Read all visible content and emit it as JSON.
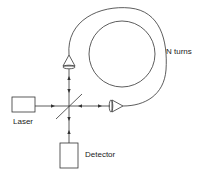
{
  "diagram": {
    "type": "fiber optic gyroscope (Sagnac interferometer) schematic",
    "labels": {
      "laser": "Laser",
      "detector": "Detector",
      "coil": "N turns"
    },
    "components": [
      {
        "name": "laser",
        "shape": "rectangle"
      },
      {
        "name": "beam-splitter",
        "shape": "diagonal line"
      },
      {
        "name": "top-coupling-lens",
        "shape": "triangle-up"
      },
      {
        "name": "right-coupling-lens",
        "shape": "triangle-right"
      },
      {
        "name": "fiber-coil",
        "shape": "loop with N turns"
      },
      {
        "name": "detector",
        "shape": "rectangle"
      }
    ],
    "colors": {
      "line": "#333333",
      "background": "#ffffff"
    }
  }
}
